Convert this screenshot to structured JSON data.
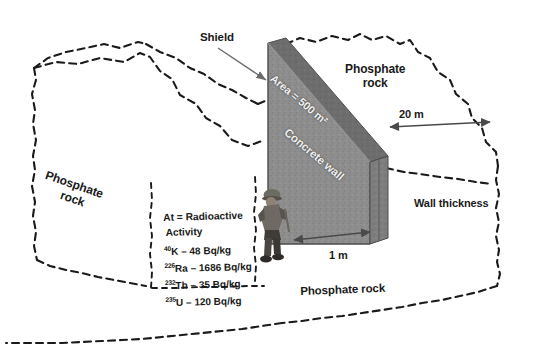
{
  "figure": {
    "background": "#ffffff",
    "ink": "#1a1a1a"
  },
  "labels": {
    "shield": "Shield",
    "rock_left_line1": "Phosphate",
    "rock_left_line2": "rock",
    "rock_top_line1": "Phosphate",
    "rock_top_line2": "rock",
    "rock_bottom": "Phosphate rock",
    "wall_thickness": "Wall thickness",
    "area": "Area = 500 m²",
    "wall": "Concrete wall"
  },
  "dimensions": {
    "length": "20 m",
    "thickness": "1 m"
  },
  "activity": {
    "header_line1": "At = Radioactive",
    "header_line2": "Activity",
    "entries": [
      {
        "mass": "40",
        "element": "K",
        "dash": "–",
        "value": "48 Bq/kg"
      },
      {
        "mass": "226",
        "element": "Ra",
        "dash": "–",
        "value": "1686 Bq/kg"
      },
      {
        "mass": "232",
        "element": "Th",
        "dash": "–",
        "value": "35 Bq/kg"
      },
      {
        "mass": "235",
        "element": "U",
        "dash": "–",
        "value": "120 Bq/kg"
      }
    ]
  },
  "colors": {
    "wall_face": "#8d8d8d",
    "wall_top": "#6f6f6f",
    "wall_side": "#7d7d7d",
    "outline": "#1a1a1a",
    "arrow": "#555555"
  },
  "icons": {
    "worker": "worker-photo",
    "arrow_shield": "arrow-pointer-icon",
    "arrow_20m": "double-arrow-icon",
    "arrow_1m": "double-arrow-icon"
  }
}
